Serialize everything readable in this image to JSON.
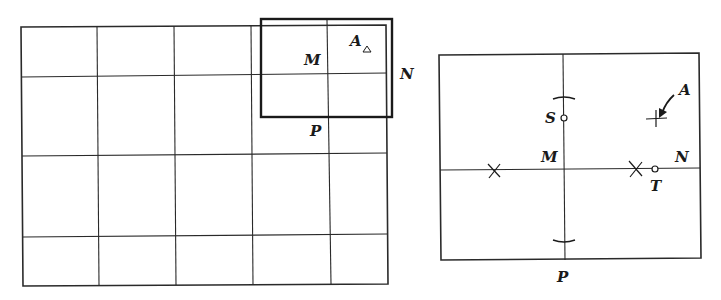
{
  "figures": {
    "left": {
      "description": "Grid with highlighted enlargement rectangle",
      "labels": {
        "A": "A",
        "M": "M",
        "N": "N",
        "P": "P"
      },
      "grid": {
        "x": [
          21,
          97,
          174,
          251,
          330,
          387
        ],
        "y": [
          26,
          76,
          155,
          236,
          284
        ]
      },
      "highlight_rect": {
        "x1": 261,
        "y1": 19,
        "x2": 392,
        "y2": 117
      }
    },
    "right": {
      "description": "Enlarged view with construction marks",
      "labels": {
        "A": "A",
        "S": "S",
        "M": "M",
        "N": "N",
        "T": "T",
        "P": "P"
      },
      "frame": {
        "x1": 439,
        "y1": 53,
        "x2": 701,
        "y2": 259
      }
    }
  },
  "colors": {
    "line": "#2a2a2a",
    "background": "#ffffff"
  }
}
